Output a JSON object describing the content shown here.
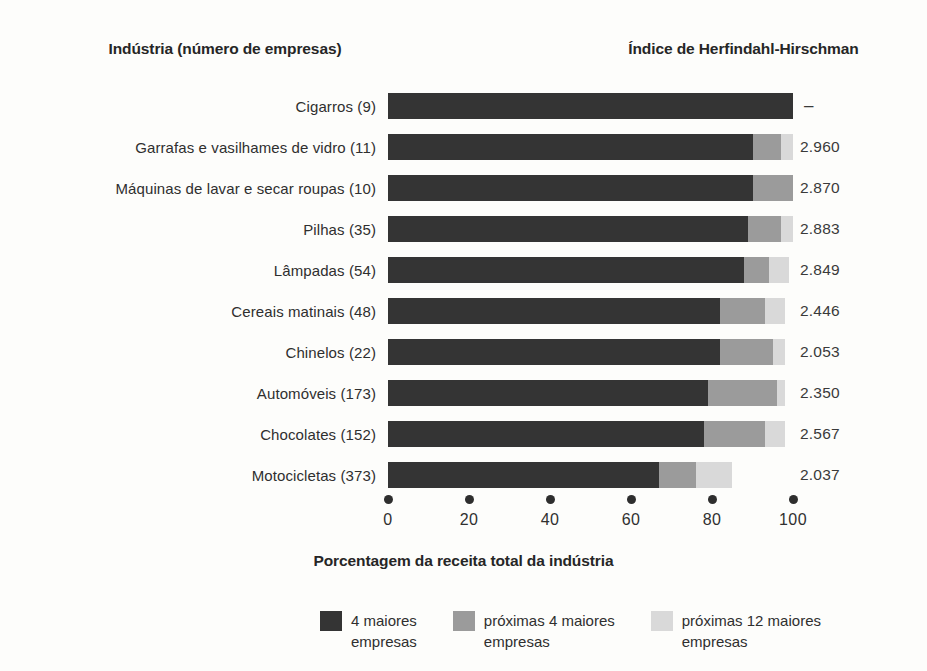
{
  "headers": {
    "left": "Indústria (número de empresas)",
    "right": "Índice de Herfindahl-Hirschman"
  },
  "xlabel": "Porcentagem da receita total da indústria",
  "axis": {
    "ticks": [
      "0",
      "20",
      "40",
      "60",
      "80",
      "100"
    ],
    "values": [
      0,
      20,
      40,
      60,
      80,
      100
    ]
  },
  "colors": {
    "top4": "#343434",
    "next4": "#9b9b9b",
    "next12": "#d9d9d9",
    "background": "#fdfdfb",
    "text": "#2f2f2f"
  },
  "legend": [
    {
      "label": "4 maiores\nempresas",
      "color": "#343434",
      "swatch": "top4-swatch"
    },
    {
      "label": "próximas 4 maiores\nempresas",
      "color": "#9b9b9b",
      "swatch": "next4-swatch"
    },
    {
      "label": "próximas 12 maiores\nempresas",
      "color": "#d9d9d9",
      "swatch": "next12-swatch"
    }
  ],
  "chart_data": {
    "type": "bar",
    "orientation": "horizontal",
    "stacked": true,
    "title": "",
    "xlabel": "Porcentagem da receita total da indústria",
    "ylabel": "Indústria (número de empresas)",
    "xlim": [
      0,
      100
    ],
    "grid": false,
    "legend_position": "bottom",
    "series": [
      {
        "name": "4 maiores empresas",
        "color": "#343434",
        "values": [
          100,
          90,
          90,
          89,
          88,
          82,
          82,
          79,
          78,
          67
        ]
      },
      {
        "name": "próximas 4 maiores empresas",
        "color": "#9b9b9b",
        "values": [
          0,
          7,
          10,
          8,
          6,
          11,
          13,
          17,
          15,
          9
        ]
      },
      {
        "name": "próximas 12 maiores empresas",
        "color": "#d9d9d9",
        "values": [
          0,
          3,
          0,
          3,
          5,
          5,
          3,
          2,
          5,
          9
        ]
      }
    ],
    "categories": [
      "Cigarros (9)",
      "Garrafas e vasilhames de vidro  (11)",
      "Máquinas de lavar e secar roupas  (10)",
      "Pilhas  (35)",
      "Lâmpadas  (54)",
      "Cereais matinais  (48)",
      "Chinelos  (22)",
      "Automóveis  (173)",
      "Chocolates  (152)",
      "Motocicletas  (373)"
    ],
    "annotations_column": {
      "header": "Índice de Herfindahl-Hirschman",
      "values": [
        "–",
        "2.960",
        "2.870",
        "2.883",
        "2.849",
        "2.446",
        "2.053",
        "2.350",
        "2.567",
        "2.037"
      ]
    }
  },
  "rows": [
    {
      "label": "Cigarros (9)",
      "firms": 9,
      "s1": 100,
      "s2": 0,
      "s3": 0,
      "hhi": "–"
    },
    {
      "label": "Garrafas e vasilhames de vidro  (11)",
      "firms": 11,
      "s1": 90,
      "s2": 7,
      "s3": 3,
      "hhi": "2.960"
    },
    {
      "label": "Máquinas de lavar e secar roupas  (10)",
      "firms": 10,
      "s1": 90,
      "s2": 10,
      "s3": 0,
      "hhi": "2.870"
    },
    {
      "label": "Pilhas  (35)",
      "firms": 35,
      "s1": 89,
      "s2": 8,
      "s3": 3,
      "hhi": "2.883"
    },
    {
      "label": "Lâmpadas  (54)",
      "firms": 54,
      "s1": 88,
      "s2": 6,
      "s3": 5,
      "hhi": "2.849"
    },
    {
      "label": "Cereais matinais  (48)",
      "firms": 48,
      "s1": 82,
      "s2": 11,
      "s3": 5,
      "hhi": "2.446"
    },
    {
      "label": "Chinelos  (22)",
      "firms": 22,
      "s1": 82,
      "s2": 13,
      "s3": 3,
      "hhi": "2.053"
    },
    {
      "label": "Automóveis  (173)",
      "firms": 173,
      "s1": 79,
      "s2": 17,
      "s3": 2,
      "hhi": "2.350"
    },
    {
      "label": "Chocolates  (152)",
      "firms": 152,
      "s1": 78,
      "s2": 15,
      "s3": 5,
      "hhi": "2.567"
    },
    {
      "label": "Motocicletas  (373)",
      "firms": 373,
      "s1": 67,
      "s2": 9,
      "s3": 9,
      "hhi": "2.037"
    }
  ]
}
